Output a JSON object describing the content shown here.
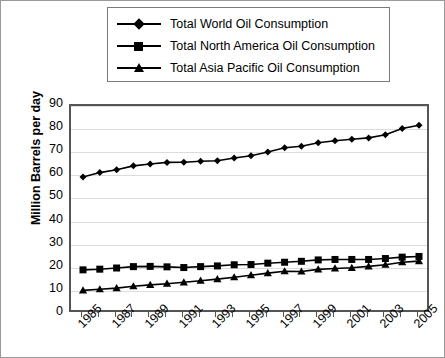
{
  "chart_data": {
    "type": "line",
    "title": "",
    "xlabel": "",
    "ylabel": "Million Barrels per day",
    "ylim": [
      0,
      90
    ],
    "ytick_step": 10,
    "yticks": [
      "90",
      "80",
      "70",
      "60",
      "50",
      "40",
      "30",
      "20",
      "10",
      "0"
    ],
    "grid": true,
    "legend_position": "top",
    "x": [
      1985,
      1986,
      1987,
      1988,
      1989,
      1990,
      1991,
      1992,
      1993,
      1994,
      1995,
      1996,
      1997,
      1998,
      1999,
      2000,
      2001,
      2002,
      2003,
      2004,
      2005
    ],
    "xtick_labels": [
      "1985",
      "1987",
      "1989",
      "1991",
      "1993",
      "1995",
      "1997",
      "1999",
      "2001",
      "2003",
      "2005"
    ],
    "xlim": [
      1985,
      2005
    ],
    "series": [
      {
        "name": "Total World Oil Consumption",
        "marker": "diamond",
        "color": "#000000",
        "values": [
          59.3,
          61.2,
          62.4,
          64.1,
          64.9,
          65.6,
          65.7,
          66.1,
          66.3,
          67.5,
          68.5,
          70.1,
          71.9,
          72.6,
          74.1,
          75.0,
          75.6,
          76.2,
          77.6,
          80.3,
          81.7
        ]
      },
      {
        "name": "Total North America Oil Consumption",
        "marker": "square",
        "color": "#000000",
        "values": [
          19.1,
          19.4,
          19.9,
          20.5,
          20.6,
          20.4,
          20.1,
          20.5,
          20.8,
          21.3,
          21.4,
          22.0,
          22.4,
          22.8,
          23.4,
          23.6,
          23.6,
          23.6,
          24.0,
          24.6,
          24.9
        ]
      },
      {
        "name": "Total Asia Pacific Oil Consumption",
        "marker": "triangle",
        "color": "#000000",
        "values": [
          10.2,
          10.7,
          11.2,
          12.0,
          12.6,
          13.1,
          13.7,
          14.4,
          15.1,
          15.9,
          16.8,
          17.7,
          18.5,
          18.4,
          19.3,
          19.7,
          20.0,
          20.6,
          21.3,
          22.4,
          22.9
        ]
      }
    ]
  },
  "legend": {
    "items": [
      {
        "label": "Total World Oil Consumption",
        "marker": "diamond"
      },
      {
        "label": "Total North America Oil Consumption",
        "marker": "square"
      },
      {
        "label": "Total Asia Pacific Oil Consumption",
        "marker": "triangle"
      }
    ]
  },
  "axes": {
    "y_title": "Million Barrels per day"
  }
}
